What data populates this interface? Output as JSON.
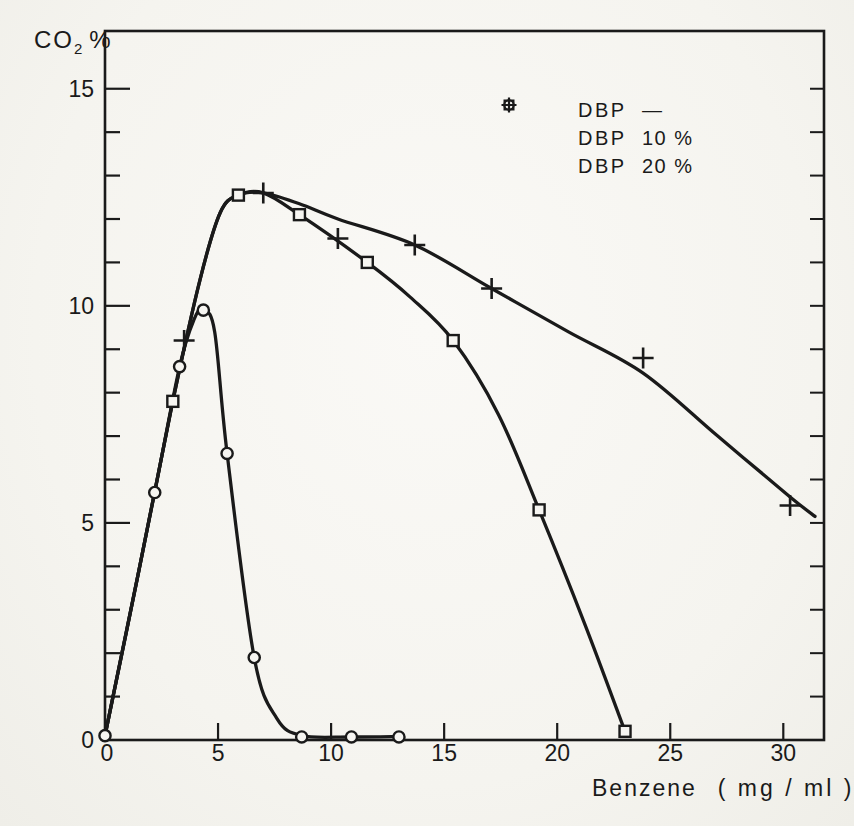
{
  "colors": {
    "ink": "#1a1a1a",
    "paper": "#f6f5f1"
  },
  "y_axis_title": {
    "main": "CO",
    "sub": "2",
    "suffix": "%"
  },
  "x_axis_title": {
    "word": "Benzene",
    "units": "( mg / ml )"
  },
  "legend": {
    "items": [
      {
        "marker": "circle",
        "name": "DBP",
        "value": "—"
      },
      {
        "marker": "square",
        "name": "DBP",
        "value": "10 %"
      },
      {
        "marker": "plus",
        "name": "DBP",
        "value": "20 %"
      }
    ]
  },
  "chart_data": {
    "type": "line",
    "title": "",
    "xlabel": "Benzene ( mg / ml )",
    "ylabel": "CO2 %",
    "xlim": [
      0,
      31.8
    ],
    "ylim": [
      0,
      16.33
    ],
    "x_tick_labels": [
      0,
      5,
      10,
      15,
      20,
      25,
      30
    ],
    "y_tick_labels": [
      0,
      5,
      10,
      15
    ],
    "y_unit_ticks": {
      "from": 1,
      "to": 15,
      "step": 1
    },
    "grid": false,
    "frame": true,
    "legend_position": "upper-right-inside",
    "series": [
      {
        "name": "DBP —",
        "marker": "circle",
        "points": [
          [
            0,
            0.1
          ],
          [
            2.2,
            5.7
          ],
          [
            3.3,
            8.6
          ],
          [
            4.35,
            9.9
          ],
          [
            5.4,
            6.6
          ],
          [
            6.6,
            1.9
          ],
          [
            8.7,
            0.07
          ],
          [
            10.9,
            0.07
          ],
          [
            13,
            0.07
          ]
        ],
        "curve": [
          [
            0,
            0.1
          ],
          [
            1.1,
            2.9
          ],
          [
            2.2,
            5.7
          ],
          [
            3.3,
            8.6
          ],
          [
            3.95,
            9.7
          ],
          [
            4.35,
            9.9
          ],
          [
            4.85,
            9.4
          ],
          [
            5.4,
            6.6
          ],
          [
            6.6,
            1.9
          ],
          [
            7.6,
            0.5
          ],
          [
            8.7,
            0.1
          ],
          [
            10.9,
            0.07
          ],
          [
            13,
            0.08
          ]
        ]
      },
      {
        "name": "DBP 10 %",
        "marker": "square",
        "points": [
          [
            3,
            7.8
          ],
          [
            5.9,
            12.55
          ],
          [
            8.6,
            12.1
          ],
          [
            11.6,
            11
          ],
          [
            15.4,
            9.2
          ],
          [
            19.2,
            5.3
          ],
          [
            23,
            0.2
          ]
        ],
        "curve": [
          [
            0,
            0.1
          ],
          [
            1.5,
            3.9
          ],
          [
            3,
            7.8
          ],
          [
            4.2,
            10.6
          ],
          [
            5.1,
            12.15
          ],
          [
            5.9,
            12.55
          ],
          [
            7,
            12.6
          ],
          [
            8.6,
            12.1
          ],
          [
            11.6,
            11
          ],
          [
            13.5,
            10.2
          ],
          [
            15.4,
            9.2
          ],
          [
            17.4,
            7.5
          ],
          [
            19.2,
            5.3
          ],
          [
            21.2,
            2.7
          ],
          [
            23,
            0.2
          ]
        ]
      },
      {
        "name": "DBP 20 %",
        "marker": "plus",
        "points": [
          [
            3.5,
            9.2
          ],
          [
            7,
            12.6
          ],
          [
            10.3,
            11.55
          ],
          [
            13.7,
            11.4
          ],
          [
            17.1,
            10.4
          ],
          [
            23.8,
            8.8
          ],
          [
            30.3,
            5.4
          ]
        ],
        "curve": [
          [
            0,
            0.1
          ],
          [
            1.5,
            3.9
          ],
          [
            3,
            7.8
          ],
          [
            4.2,
            10.6
          ],
          [
            5.1,
            12.15
          ],
          [
            5.9,
            12.55
          ],
          [
            7,
            12.6
          ],
          [
            8.6,
            12.35
          ],
          [
            10.3,
            12.0
          ],
          [
            13.7,
            11.4
          ],
          [
            17.1,
            10.4
          ],
          [
            20.5,
            9.4
          ],
          [
            23.8,
            8.45
          ],
          [
            27.1,
            7.0
          ],
          [
            30.3,
            5.6
          ],
          [
            31.4,
            5.15
          ]
        ]
      }
    ]
  }
}
